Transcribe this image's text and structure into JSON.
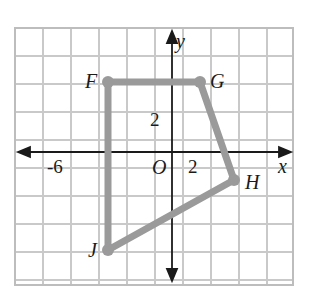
{
  "figure": {
    "type": "coordinate-plane-polygon",
    "background": "#ffffff",
    "grid": {
      "color": "#c9c9c9",
      "border_color": "#bdbdbd",
      "spacing_px": 28,
      "left_px": 15,
      "top_px": 28,
      "right_px": 293,
      "bottom_px": 285,
      "columns": 10,
      "rows": 9,
      "visible": true
    },
    "axes": {
      "color": "#1a1a1a",
      "origin_px": {
        "x": 172,
        "y": 152
      },
      "x_axis": {
        "label": "x",
        "arrow_left": true,
        "arrow_right": true
      },
      "y_axis": {
        "label": "y",
        "arrow_up": true,
        "arrow_down": true
      },
      "origin_label": "O",
      "tick_labels": [
        {
          "text": "-6",
          "axis": "x",
          "value": -6
        },
        {
          "text": "2",
          "axis": "x",
          "value": 2
        },
        {
          "text": "2",
          "axis": "y",
          "value": 2
        }
      ]
    },
    "polygon": {
      "name": "FGHJ",
      "stroke_color": "#9a9a9a",
      "stroke_width_px": 7,
      "vertex_dot_radius_px": 6,
      "closed": true,
      "vertices": [
        {
          "label": "F",
          "x": -2.3,
          "y": 2.5,
          "px": 108,
          "py": 82,
          "label_side": "left"
        },
        {
          "label": "G",
          "x": 1.0,
          "y": 2.5,
          "px": 200,
          "py": 82,
          "label_side": "right"
        },
        {
          "label": "H",
          "x": 2.2,
          "y": -1.0,
          "px": 234,
          "py": 180,
          "label_side": "right"
        },
        {
          "label": "J",
          "x": -2.3,
          "y": -3.5,
          "px": 108,
          "py": 250,
          "label_side": "left"
        }
      ]
    }
  },
  "chart_data": {
    "type": "scatter",
    "title": "",
    "xlabel": "x",
    "ylabel": "y",
    "grid": true,
    "legend": "none",
    "xlim": [
      -6.6,
      4.9
    ],
    "ylim": [
      -4.5,
      4.5
    ],
    "series": [
      {
        "name": "Polygon FGHJ",
        "point_labels": [
          "F",
          "G",
          "H",
          "J"
        ],
        "x": [
          -2.3,
          1.0,
          2.2,
          -2.3
        ],
        "y": [
          2.5,
          2.5,
          -1.0,
          -3.5
        ],
        "closed": true,
        "color": "#9a9a9a"
      }
    ],
    "annotations": [
      "-6",
      "2",
      "2",
      "O",
      "x",
      "y"
    ]
  }
}
